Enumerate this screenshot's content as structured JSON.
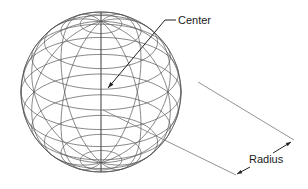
{
  "diagram": {
    "colors": {
      "wire": "#555555",
      "text": "#1a1a1a",
      "background": "#ffffff"
    },
    "sphere": {
      "cx": 101,
      "cy": 92,
      "r": 80,
      "tilt_deg": 28,
      "latitudes_deg": [
        -75,
        -60,
        -45,
        -30,
        -15,
        0,
        15,
        30,
        45,
        60,
        75
      ],
      "meridian_count": 12
    },
    "labels": {
      "center": "Center",
      "radius": "Radius"
    },
    "center_callout": {
      "text_x": 178,
      "text_y": 24,
      "line": [
        [
          176,
          20
        ],
        [
          165,
          20
        ],
        [
          108,
          88
        ]
      ]
    },
    "radius_dimension": {
      "ext_upper": [
        [
          198,
          82
        ],
        [
          294,
          140
        ]
      ],
      "ext_lower": [
        [
          103,
          110
        ],
        [
          236,
          175
        ]
      ],
      "arrow_upper": [
        [
          273,
          153
        ],
        [
          291,
          142
        ]
      ],
      "arrow_lower": [
        [
          250,
          167
        ],
        [
          237,
          174
        ]
      ],
      "text_x": 249,
      "text_y": 163
    }
  }
}
